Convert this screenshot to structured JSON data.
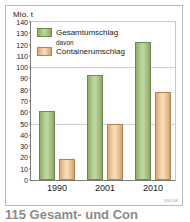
{
  "figure": {
    "unit_label": "Mio. t",
    "figure_code": "166208",
    "caption_partial": "115 Gesamt- und Con"
  },
  "legend": {
    "items": [
      {
        "label": "Gesamtumschlag",
        "color": "#a9c487",
        "swatch": "total"
      },
      {
        "label": "Containerumschlag",
        "color": "#eac79c",
        "swatch": "container"
      }
    ],
    "sub_note": "davon"
  },
  "chart_data": {
    "type": "bar",
    "title": "",
    "xlabel": "",
    "ylabel": "Mio. t",
    "ylim": [
      0,
      140
    ],
    "ytick_step": 10,
    "yticks": [
      0,
      10,
      20,
      30,
      40,
      50,
      60,
      70,
      80,
      90,
      100,
      110,
      120,
      130,
      140
    ],
    "grid": true,
    "legend_position": "top-left",
    "categories": [
      "1990",
      "2001",
      "2010"
    ],
    "series": [
      {
        "name": "Gesamtumschlag",
        "color": "#a9c487",
        "values": [
          61,
          93,
          122
        ]
      },
      {
        "name": "Containerumschlag",
        "color": "#eac79c",
        "values": [
          19,
          50,
          78
        ]
      }
    ]
  }
}
